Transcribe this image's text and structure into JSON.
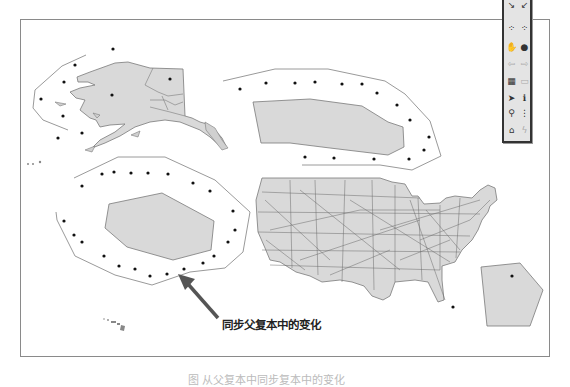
{
  "map": {
    "colors": {
      "land_fill": "#d9d9d9",
      "land_stroke": "#7a7a7a",
      "boundary_line": "#9a9a9a",
      "point": "#111111",
      "frame": "#8a8a8a",
      "arrow": "#555555"
    },
    "features": [
      "alaska",
      "hawaii",
      "contiguous-us-with-highways",
      "top-right-replica-polygon",
      "left-replica-polygon",
      "bottom-right-replica-polygon"
    ]
  },
  "callout": {
    "label": "同步父复本中的变化"
  },
  "toolbar": {
    "tools": [
      {
        "name": "zoom-in",
        "glyph": "↘"
      },
      {
        "name": "zoom-out",
        "glyph": "↙"
      },
      {
        "name": "fixed-zoom-in",
        "glyph": "⁘"
      },
      {
        "name": "fixed-zoom-out",
        "glyph": "⁘"
      },
      {
        "name": "pan",
        "glyph": "✋"
      },
      {
        "name": "full-extent",
        "glyph": "●"
      },
      {
        "name": "go-back",
        "glyph": "⇦"
      },
      {
        "name": "go-forward",
        "glyph": "⇨"
      },
      {
        "name": "select-features",
        "glyph": "▦"
      },
      {
        "name": "clear-selection",
        "glyph": "▭"
      },
      {
        "name": "select-elements",
        "glyph": "➤"
      },
      {
        "name": "identify",
        "glyph": "ℹ"
      },
      {
        "name": "find",
        "glyph": "⚲"
      },
      {
        "name": "measure",
        "glyph": "⋮"
      },
      {
        "name": "hyperlink",
        "glyph": "⌂"
      },
      {
        "name": "html-popup",
        "glyph": "ϟ"
      }
    ]
  },
  "caption": {
    "text": "图 从父复本中同步复本中的变化"
  }
}
